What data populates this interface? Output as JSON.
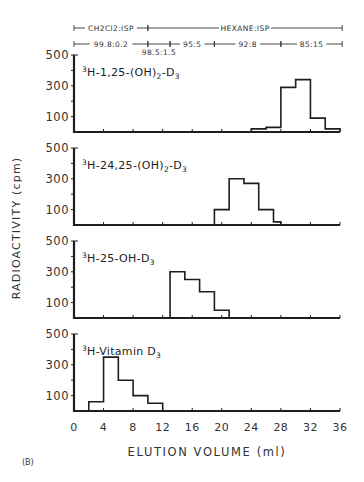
{
  "figure": {
    "label": "(B)",
    "xlabel": "ELUTION VOLUME (ml)",
    "ylabel": "RADIOACTIVITY (cpm)"
  },
  "solvents": {
    "row1": [
      {
        "label": "CH2Cl2:ISP",
        "from": 0,
        "to": 10
      },
      {
        "label": "HEXANE:ISP",
        "from": 10,
        "to": 36.3
      }
    ],
    "row2": [
      {
        "label": "99.8:0.2",
        "from": 0,
        "to": 10
      },
      {
        "label": "98.5:1.5",
        "from": 10,
        "to": 13,
        "below": true
      },
      {
        "label": "95:5",
        "from": 13,
        "to": 19
      },
      {
        "label": "92:8",
        "from": 19,
        "to": 28
      },
      {
        "label": "85:15",
        "from": 28,
        "to": 36.3
      }
    ]
  },
  "chart_data": {
    "type": "bar",
    "subtype": "step-histogram, 4 stacked panels sharing x-axis",
    "xlabel": "ELUTION VOLUME (ml)",
    "ylabel": "RADIOACTIVITY (cpm)",
    "xlim": [
      0,
      36
    ],
    "xticks": [
      0,
      4,
      8,
      12,
      16,
      20,
      24,
      28,
      32,
      36
    ],
    "ylim": [
      0,
      500
    ],
    "yticks_labeled": [
      100,
      300,
      500
    ],
    "yticks_minor": [
      200,
      400
    ],
    "grid": false,
    "series": [
      {
        "name": "3H-1,25-(OH)2-D3",
        "label_parts": {
          "sup": "3",
          "pre": "H-1,25-(OH)",
          "sub1": "2",
          "mid": "-D",
          "sub2": "3"
        },
        "bins": [
          {
            "x0": 24,
            "x1": 26,
            "y": 20
          },
          {
            "x0": 26,
            "x1": 28,
            "y": 30
          },
          {
            "x0": 28,
            "x1": 30,
            "y": 290
          },
          {
            "x0": 30,
            "x1": 32,
            "y": 340
          },
          {
            "x0": 32,
            "x1": 34,
            "y": 90
          },
          {
            "x0": 34,
            "x1": 36,
            "y": 20
          }
        ]
      },
      {
        "name": "3H-24,25-(OH)2-D3",
        "label_parts": {
          "sup": "3",
          "pre": "H-24,25-(OH)",
          "sub1": "2",
          "mid": "-D",
          "sub2": "3"
        },
        "bins": [
          {
            "x0": 19,
            "x1": 21,
            "y": 100
          },
          {
            "x0": 21,
            "x1": 23,
            "y": 300
          },
          {
            "x0": 23,
            "x1": 25,
            "y": 270
          },
          {
            "x0": 25,
            "x1": 27,
            "y": 100
          },
          {
            "x0": 27,
            "x1": 28,
            "y": 20
          }
        ]
      },
      {
        "name": "3H-25-OH-D3",
        "label_parts": {
          "sup": "3",
          "pre": "H-25-OH-D",
          "sub1": "",
          "mid": "",
          "sub2": "3"
        },
        "bins": [
          {
            "x0": 13,
            "x1": 15,
            "y": 300
          },
          {
            "x0": 15,
            "x1": 17,
            "y": 250
          },
          {
            "x0": 17,
            "x1": 19,
            "y": 170
          },
          {
            "x0": 19,
            "x1": 21,
            "y": 50
          }
        ]
      },
      {
        "name": "3H-Vitamin D3",
        "label_parts": {
          "sup": "3",
          "pre": "H-Vitamin D",
          "sub1": "",
          "mid": "",
          "sub2": "3"
        },
        "bins": [
          {
            "x0": 2,
            "x1": 4,
            "y": 60
          },
          {
            "x0": 4,
            "x1": 6,
            "y": 350
          },
          {
            "x0": 6,
            "x1": 8,
            "y": 200
          },
          {
            "x0": 8,
            "x1": 10,
            "y": 100
          },
          {
            "x0": 10,
            "x1": 12,
            "y": 50
          }
        ]
      }
    ]
  }
}
